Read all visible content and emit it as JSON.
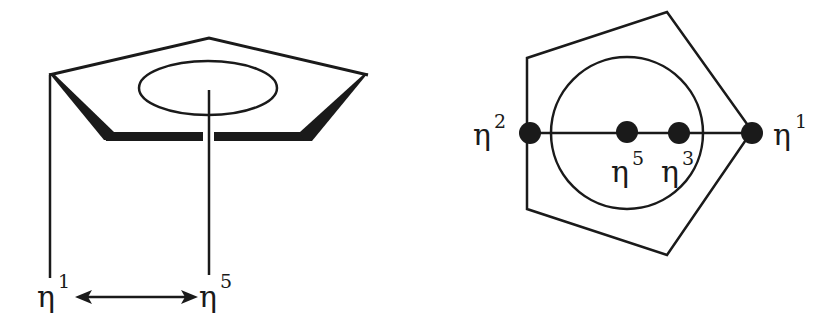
{
  "figure": {
    "colors": {
      "ink": "#1a1a1a",
      "background": "#ffffff"
    }
  },
  "left_panel": {
    "labels": {
      "eta1": {
        "base": "η",
        "sup": "1"
      },
      "eta5": {
        "base": "η",
        "sup": "5"
      }
    },
    "arrow": "double-headed arrow between η1 and η5"
  },
  "right_panel": {
    "labels": {
      "eta2": {
        "base": "η",
        "sup": "2"
      },
      "eta5": {
        "base": "η",
        "sup": "5"
      },
      "eta3": {
        "base": "η",
        "sup": "3"
      },
      "eta1": {
        "base": "η",
        "sup": "1"
      }
    }
  }
}
